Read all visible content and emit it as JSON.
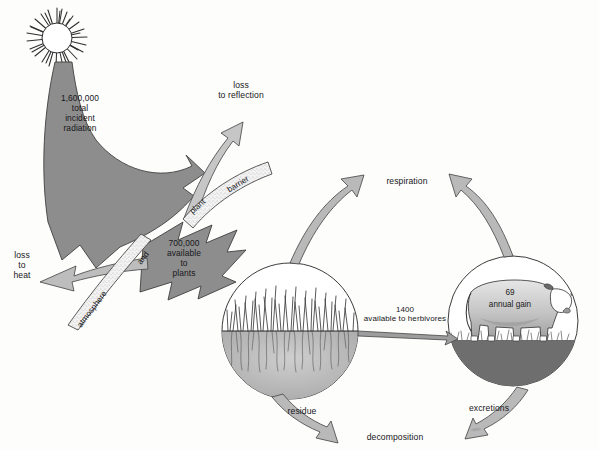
{
  "diagram": {
    "sun": {
      "name": "sun"
    },
    "flows": {
      "incident": "1,600,000\ntotal\nincident\nradiation",
      "available": "700,000\navailable\nto\nplants",
      "loss_reflection": "loss\nto reflection",
      "loss_heat": "loss\nto\nheat",
      "herbivores": "1400\navailable to herbivores",
      "respiration": "respiration",
      "residue": "residue",
      "decomposition": "decomposition",
      "excretions": "excretions"
    },
    "barriers": {
      "plant": "plant",
      "plant_end": "barrier",
      "atmosphere": "atmosphere",
      "atmosphere_end": "and"
    },
    "cow": {
      "value": "69",
      "caption": "annual gain"
    },
    "circles": {
      "producers": "grass-circle",
      "consumers": "cow-circle"
    },
    "colors": {
      "arrow_dark": "#8a8a8a",
      "arrow_mid": "#a8a8a8",
      "arrow_light": "#c9c9c9",
      "outline": "#4a4a4a",
      "soil": "#b9b9b9",
      "text": "#17171a"
    }
  }
}
